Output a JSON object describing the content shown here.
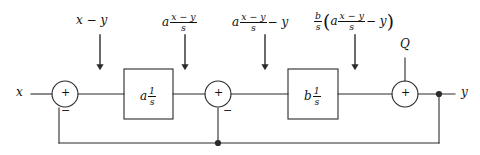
{
  "diagram": {
    "stroke_color": "#2b2b2b",
    "text_color": "#111111",
    "background_color": "#ffffff",
    "input": {
      "label": "x"
    },
    "output": {
      "label": "y"
    },
    "disturbance": {
      "label": "Q"
    },
    "blocks": [
      {
        "name": "block-a",
        "gain": "a",
        "transfer_num": "1",
        "transfer_den": "s"
      },
      {
        "name": "block-b",
        "gain": "b",
        "transfer_num": "1",
        "transfer_den": "s"
      }
    ],
    "summers": [
      {
        "name": "summing-junction-1",
        "plus": "+",
        "minus": "−"
      },
      {
        "name": "summing-junction-2",
        "plus": "+",
        "minus": "−"
      },
      {
        "name": "summing-junction-3",
        "plus": "+"
      }
    ],
    "annotations": [
      {
        "name": "signal-label-error",
        "parts": {
          "lead": "x − y"
        }
      },
      {
        "name": "signal-label-after-block-a",
        "parts": {
          "lead": "a",
          "num": "x − y",
          "den": "s"
        }
      },
      {
        "name": "signal-label-after-summer-2",
        "parts": {
          "lead": "a",
          "num": "x − y",
          "den": "s",
          "tail": "− y"
        }
      },
      {
        "name": "signal-label-after-block-b",
        "parts": {
          "outer_num": "b",
          "outer_den": "s",
          "open": "(",
          "lead": "a",
          "num": "x − y",
          "den": "s",
          "tail": "− y",
          "close": ")"
        }
      }
    ]
  }
}
